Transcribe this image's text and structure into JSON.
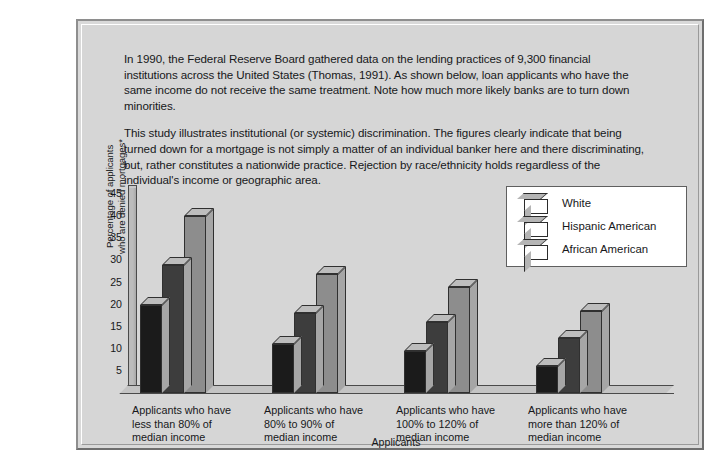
{
  "figure": {
    "paragraphs": [
      "In 1990, the Federal Reserve Board gathered data on the lending practices of 9,300 financial institutions across the United States (Thomas, 1991). As shown below, loan applicants who have the same income do not receive the same treatment. Note how much more likely banks are to turn down minorities.",
      "This study illustrates institutional (or systemic) discrimination. The figures clearly indicate that being turned down for a mortgage is not simply a matter of an individual banker here and there discriminating, but, rather constitutes a nationwide practice. Rejection by race/ethnicity holds regardless of the individual's income or geographic area."
    ]
  },
  "colors": {
    "panel_background": "#d6d6d6",
    "series_white": "#1b1b1b",
    "series_hispanic": "#3d3d3d",
    "series_african": "#8d8d8d",
    "axis_line": "#4a4a4a",
    "legend_background": "#ffffff"
  },
  "chart_data": {
    "type": "bar",
    "title": "",
    "xlabel": "Applicants",
    "ylabel": "Percentage of applicants who are denied mortgages*",
    "ylabel_line1": "Percentage of applicants",
    "ylabel_line2": "who are denied mortgages*",
    "ylim": [
      0,
      47
    ],
    "yticks": [
      5,
      10,
      15,
      20,
      25,
      30,
      35,
      40,
      45
    ],
    "grid": false,
    "legend_position": "upper right",
    "categories": [
      "Applicants who have less than 80% of median income",
      "Applicants who have 80% to 90% of median income",
      "Applicants who have 100% to 120% of median income",
      "Applicants who have more than 120% of median income"
    ],
    "category_lines": [
      [
        "Applicants who have",
        "less than 80% of",
        "median income"
      ],
      [
        "Applicants who have",
        "80% to 90% of",
        "median income"
      ],
      [
        "Applicants who have",
        "100% to 120% of",
        "median income"
      ],
      [
        "Applicants who have",
        "more than 120% of",
        "median income"
      ]
    ],
    "series": [
      {
        "name": "White",
        "values": [
          20,
          11,
          9.5,
          6
        ]
      },
      {
        "name": "Hispanic American",
        "values": [
          29,
          18,
          16,
          12.5
        ]
      },
      {
        "name": "African American",
        "values": [
          40,
          27,
          24,
          18.5
        ]
      }
    ]
  },
  "legend": {
    "items": [
      {
        "label": "White",
        "color": "#1b1b1b"
      },
      {
        "label": "Hispanic American",
        "color": "#3d3d3d"
      },
      {
        "label": "African American",
        "color": "#8d8d8d"
      }
    ]
  }
}
